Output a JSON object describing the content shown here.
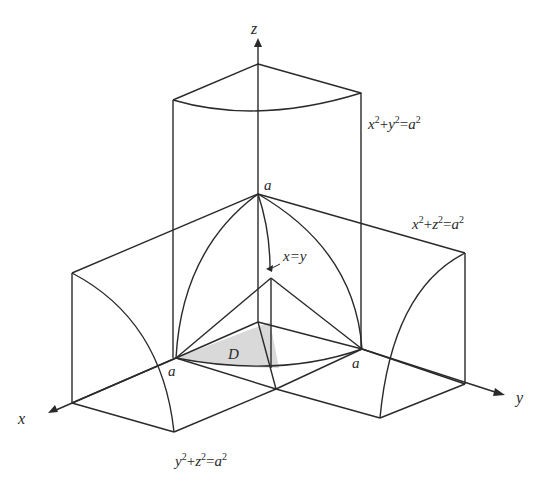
{
  "figure": {
    "axes": {
      "x": "x",
      "y": "y",
      "z": "z"
    },
    "labels": {
      "cyl_xy": {
        "base": [
          "x",
          "2",
          "+",
          "y",
          "2",
          "=",
          "a",
          "2"
        ]
      },
      "cyl_xz": {
        "base": [
          "x",
          "2",
          "+",
          "z",
          "2",
          "=",
          "a",
          "2"
        ]
      },
      "cyl_yz": {
        "base": [
          "y",
          "2",
          "+",
          "z",
          "2",
          "=",
          "a",
          "2"
        ]
      },
      "plane": "x=y",
      "region": "D",
      "apex_a": "a",
      "left_a": "a",
      "right_a": "a"
    },
    "colors": {
      "line": "#2a2a2a",
      "region_fill": "#d9d9d9"
    }
  }
}
